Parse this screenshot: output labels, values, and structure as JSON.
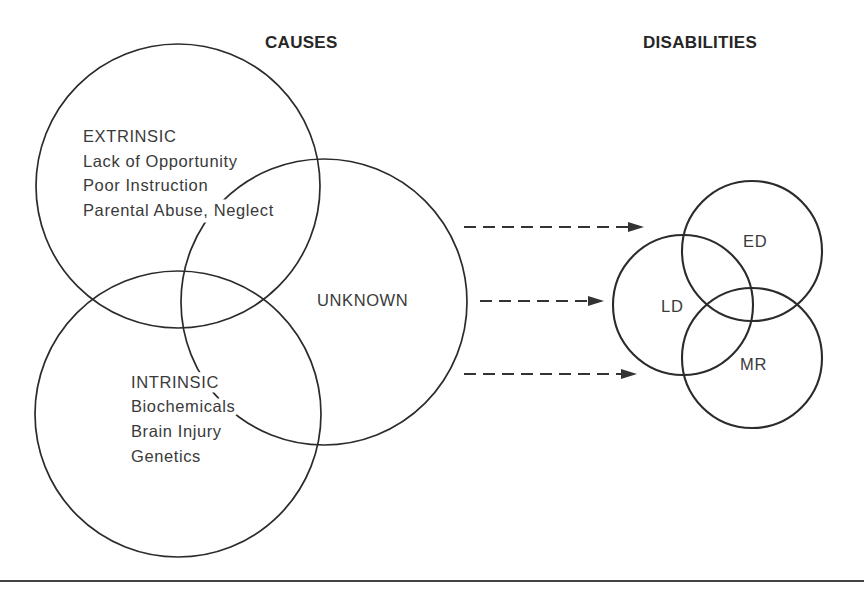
{
  "headings": {
    "causes": "CAUSES",
    "disabilities": "DISABILITIES"
  },
  "causes": {
    "extrinsic": {
      "title": "EXTRINSIC",
      "items": [
        "Lack of Opportunity",
        "Poor Instruction",
        "Parental Abuse, Neglect"
      ]
    },
    "intrinsic": {
      "title": "INTRINSIC",
      "items": [
        "Biochemicals",
        "Brain Injury",
        "Genetics"
      ]
    },
    "unknown": {
      "title": "UNKNOWN"
    }
  },
  "disabilities": {
    "ld": "LD",
    "ed": "ED",
    "mr": "MR"
  },
  "colors": {
    "stroke": "#2b2b2b",
    "text": "#3a3a3a",
    "background": "#ffffff"
  }
}
